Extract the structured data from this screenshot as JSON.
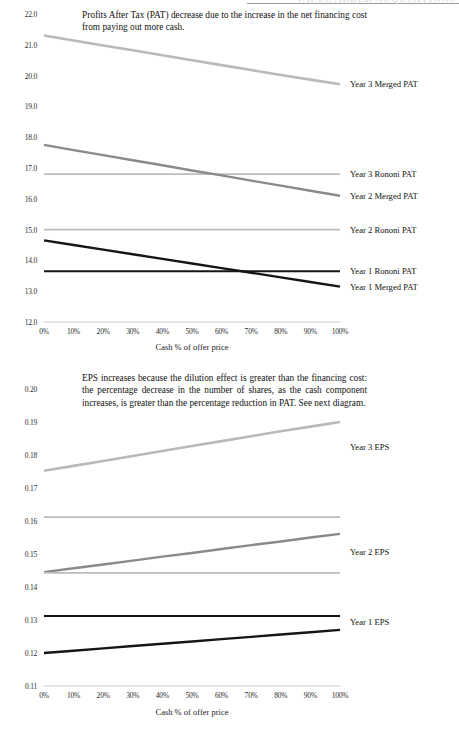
{
  "page": {
    "header_ghost": "VALUE ADDED ACQUISITIONS"
  },
  "charts": [
    {
      "id": "pat-chart",
      "note": "Profits After Tax (PAT) decrease due to the increase in the net financing cost from paying out more cash.",
      "xlabel": "Cash % of offer price",
      "ylabel": "",
      "ytick_labels": [
        "22.0",
        "21.0",
        "20.0",
        "19.0",
        "18.0",
        "17.0",
        "16.0",
        "15.0",
        "14.0",
        "13.0",
        "12.0"
      ],
      "xtick_labels": [
        "0%",
        "10%",
        "20%",
        "30%",
        "40%",
        "50%",
        "60%",
        "70%",
        "80%",
        "90%",
        "100%"
      ],
      "series_labels": [
        {
          "text": "Year 3 Merged PAT",
          "value": 19.72
        },
        {
          "text": "Year 3 Rononi PAT",
          "value": 16.8
        },
        {
          "text": "Year 2 Merged PAT",
          "value": 16.1
        },
        {
          "text": "Year 2 Rononi PAT",
          "value": 15.0
        },
        {
          "text": "Year 1 Rononi PAT",
          "value": 13.65
        },
        {
          "text": "Year 1 Merged PAT",
          "value": 13.15
        }
      ],
      "chart_data": {
        "type": "line",
        "title": "Profits After Tax (PAT) decrease due to the increase in the net financing cost from paying out more cash.",
        "xlabel": "Cash % of offer price",
        "ylabel": "",
        "xlim": [
          0,
          100
        ],
        "ylim": [
          12.0,
          22.0
        ],
        "yticks": [
          12.0,
          13.0,
          14.0,
          15.0,
          16.0,
          17.0,
          18.0,
          19.0,
          20.0,
          21.0,
          22.0
        ],
        "xticks": [
          0,
          10,
          20,
          30,
          40,
          50,
          60,
          70,
          80,
          90,
          100
        ],
        "grid": false,
        "legend": "right-inline-labels",
        "x": [
          0,
          10,
          20,
          30,
          40,
          50,
          60,
          70,
          80,
          90,
          100
        ],
        "series": [
          {
            "name": "Year 3 Merged PAT",
            "color": "#b9b9b9",
            "width": 2.6,
            "values": [
              21.3,
              21.14,
              20.98,
              20.82,
              20.66,
              20.5,
              20.34,
              20.18,
              20.02,
              19.87,
              19.72
            ]
          },
          {
            "name": "Year 3 Rononi PAT",
            "color": "#bcbcbc",
            "width": 1.8,
            "values": [
              16.8,
              16.8,
              16.8,
              16.8,
              16.8,
              16.8,
              16.8,
              16.8,
              16.8,
              16.8,
              16.8
            ]
          },
          {
            "name": "Year 2 Merged PAT",
            "color": "#8a8a8a",
            "width": 2.4,
            "values": [
              17.75,
              17.58,
              17.42,
              17.25,
              17.09,
              16.92,
              16.76,
              16.59,
              16.43,
              16.26,
              16.1
            ]
          },
          {
            "name": "Year 2 Rononi PAT",
            "color": "#bcbcbc",
            "width": 1.8,
            "values": [
              15.0,
              15.0,
              15.0,
              15.0,
              15.0,
              15.0,
              15.0,
              15.0,
              15.0,
              15.0,
              15.0
            ]
          },
          {
            "name": "Year 1 Rononi PAT",
            "color": "#151515",
            "width": 2.0,
            "values": [
              13.65,
              13.65,
              13.65,
              13.65,
              13.65,
              13.65,
              13.65,
              13.65,
              13.65,
              13.65,
              13.65
            ]
          },
          {
            "name": "Year 1 Merged PAT",
            "color": "#151515",
            "width": 2.4,
            "values": [
              14.65,
              14.5,
              14.35,
              14.2,
              14.05,
              13.9,
              13.75,
              13.6,
              13.45,
              13.3,
              13.15
            ]
          }
        ]
      }
    },
    {
      "id": "eps-chart",
      "note": "EPS increases because the dilution effect is greater than the financing cost:  the percentage decrease in the number of shares, as the cash component increases, is greater than the percentage reduction in PAT. See next diagram.",
      "xlabel": "Cash % of offer price",
      "ylabel": "",
      "ytick_labels": [
        "0.20",
        "0.19",
        "0.18",
        "0.17",
        "0.16",
        "0.15",
        "0.14",
        "0.13",
        "0.12",
        "0.11"
      ],
      "xtick_labels": [
        "0%",
        "10%",
        "20%",
        "30%",
        "40%",
        "50%",
        "60%",
        "70%",
        "80%",
        "90%",
        "100%"
      ],
      "series_labels": [
        {
          "text": "Year 3 EPS",
          "value": 0.1825
        },
        {
          "text": "Year 2 EPS",
          "value": 0.1505
        },
        {
          "text": "Year 1 EPS",
          "value": 0.1295
        }
      ],
      "chart_data": {
        "type": "line",
        "title": "EPS increases because the dilution effect is greater than the financing cost:  the percentage decrease in the number of shares, as the cash component increases, is greater than the percentage reduction in PAT. See next diagram.",
        "xlabel": "Cash % of offer price",
        "ylabel": "",
        "xlim": [
          0,
          100
        ],
        "ylim": [
          0.11,
          0.2
        ],
        "yticks": [
          0.11,
          0.12,
          0.13,
          0.14,
          0.15,
          0.16,
          0.17,
          0.18,
          0.19,
          0.2
        ],
        "xticks": [
          0,
          10,
          20,
          30,
          40,
          50,
          60,
          70,
          80,
          90,
          100
        ],
        "grid": false,
        "legend": "right-inline-labels",
        "x": [
          0,
          10,
          20,
          30,
          40,
          50,
          60,
          70,
          80,
          90,
          100
        ],
        "series": [
          {
            "name": "Year 3 Merged EPS",
            "color": "#b9b9b9",
            "width": 2.6,
            "values": [
              0.1752,
              0.1767,
              0.1782,
              0.1797,
              0.1812,
              0.1827,
              0.1842,
              0.1857,
              0.1872,
              0.1886,
              0.19
            ]
          },
          {
            "name": "Year 3 Rononi EPS",
            "color": "#bcbcbc",
            "width": 1.8,
            "values": [
              0.1612,
              0.1612,
              0.1612,
              0.1612,
              0.1612,
              0.1612,
              0.1612,
              0.1612,
              0.1612,
              0.1612,
              0.1612
            ]
          },
          {
            "name": "Year 2 Merged EPS",
            "color": "#8a8a8a",
            "width": 2.4,
            "values": [
              0.1445,
              0.1457,
              0.1468,
              0.148,
              0.1492,
              0.1503,
              0.1515,
              0.1527,
              0.1538,
              0.155,
              0.1561
            ]
          },
          {
            "name": "Year 2 Rononi EPS",
            "color": "#bcbcbc",
            "width": 1.8,
            "values": [
              0.1443,
              0.1443,
              0.1443,
              0.1443,
              0.1443,
              0.1443,
              0.1443,
              0.1443,
              0.1443,
              0.1443,
              0.1443
            ]
          },
          {
            "name": "Year 1 Rononi EPS",
            "color": "#151515",
            "width": 2.0,
            "values": [
              0.1312,
              0.1312,
              0.1312,
              0.1312,
              0.1312,
              0.1312,
              0.1312,
              0.1312,
              0.1312,
              0.1312,
              0.1312
            ]
          },
          {
            "name": "Year 1 Merged EPS",
            "color": "#151515",
            "width": 2.4,
            "values": [
              0.12,
              0.1207,
              0.1214,
              0.1221,
              0.1228,
              0.1235,
              0.1242,
              0.1249,
              0.1256,
              0.1263,
              0.127
            ]
          }
        ]
      }
    }
  ]
}
